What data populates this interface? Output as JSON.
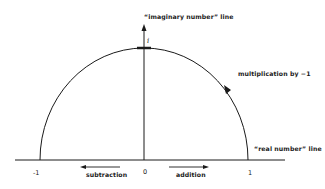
{
  "diagram": {
    "labels": {
      "imaginary_line": "“imaginary number” line",
      "real_line": "“real number” line",
      "rotation": "multiplication by −1",
      "subtraction": "subtraction",
      "addition": "addition",
      "i_mark": "i"
    },
    "ticks": {
      "minus_one": "-1",
      "zero": "0",
      "one": "1"
    },
    "colors": {
      "stroke": "#1a1a1a",
      "background": "#ffffff"
    }
  }
}
